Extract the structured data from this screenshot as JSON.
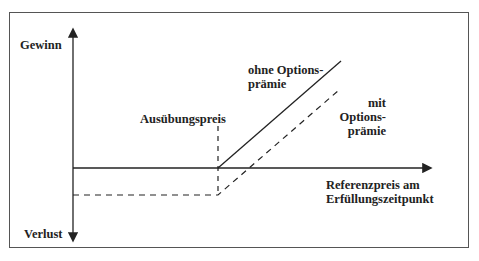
{
  "diagram": {
    "type": "option-payoff",
    "y_axis": {
      "top_label": "Gewinn",
      "bottom_label": "Verlust"
    },
    "x_axis": {
      "label_line1": "Referenzpreis am",
      "label_line2": "Erfüllungszeitpunkt"
    },
    "strike_label": "Ausübungspreis",
    "series": [
      {
        "name": "ohne Optionsprämie",
        "label_line1": "ohne Options-",
        "label_line2": "prämie",
        "style": "solid"
      },
      {
        "name": "mit Optionsprämie",
        "label_line1": "mit",
        "label_line2": "Options-",
        "label_line3": "prämie",
        "style": "dashed"
      }
    ],
    "colors": {
      "line": "#222222",
      "frame": "#555555",
      "background": "#ffffff"
    }
  }
}
